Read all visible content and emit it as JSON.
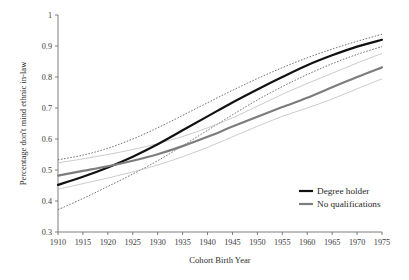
{
  "chart_data": {
    "type": "line",
    "title": "",
    "xlabel": "Cohort Birth Year",
    "ylabel": "Percentage don't mind ethnic in-law",
    "xlim": [
      1910,
      1975
    ],
    "ylim": [
      0.3,
      1
    ],
    "grid": false,
    "legend_position": "bottom-right",
    "x": [
      1910,
      1915,
      1920,
      1925,
      1930,
      1935,
      1940,
      1945,
      1950,
      1955,
      1960,
      1965,
      1970,
      1975
    ],
    "xticklabels": [
      "1910",
      "1915",
      "1920",
      "1925",
      "1930",
      "1935",
      "1940",
      "1945",
      "1950",
      "1955",
      "1960",
      "1965",
      "1970",
      "1975"
    ],
    "yticks": [
      0.3,
      0.4,
      0.5,
      0.6,
      0.7,
      0.8,
      0.9,
      1
    ],
    "yticklabels": [
      "0.3",
      "0.4",
      "0.5",
      "0.6",
      "0.7",
      "0.8",
      "0.9",
      "1"
    ],
    "series": [
      {
        "name": "Degree holder",
        "color": "#111111",
        "style": "solid",
        "values": [
          0.452,
          0.478,
          0.508,
          0.543,
          0.583,
          0.628,
          0.673,
          0.718,
          0.76,
          0.8,
          0.838,
          0.87,
          0.898,
          0.92
        ]
      },
      {
        "name": "Degree holder upper CI",
        "color": "#2b2b2b",
        "style": "dotted",
        "values": [
          0.533,
          0.548,
          0.57,
          0.6,
          0.636,
          0.676,
          0.717,
          0.757,
          0.795,
          0.83,
          0.862,
          0.89,
          0.915,
          0.938
        ]
      },
      {
        "name": "Degree holder lower CI",
        "color": "#2b2b2b",
        "style": "dotted",
        "values": [
          0.372,
          0.408,
          0.447,
          0.487,
          0.53,
          0.578,
          0.628,
          0.678,
          0.726,
          0.769,
          0.808,
          0.843,
          0.873,
          0.898
        ]
      },
      {
        "name": "No qualifications",
        "color": "#7d7d7d",
        "style": "solid",
        "values": [
          0.482,
          0.497,
          0.512,
          0.53,
          0.551,
          0.577,
          0.607,
          0.64,
          0.672,
          0.703,
          0.733,
          0.767,
          0.8,
          0.831
        ]
      },
      {
        "name": "No qualifications upper CI",
        "color": "#b4b4b4",
        "style": "solid",
        "values": [
          0.523,
          0.536,
          0.55,
          0.566,
          0.585,
          0.608,
          0.636,
          0.668,
          0.706,
          0.744,
          0.779,
          0.812,
          0.845,
          0.876
        ]
      },
      {
        "name": "No qualifications lower CI",
        "color": "#b4b4b4",
        "style": "solid",
        "values": [
          0.438,
          0.456,
          0.474,
          0.494,
          0.516,
          0.543,
          0.573,
          0.607,
          0.641,
          0.673,
          0.7,
          0.729,
          0.762,
          0.794
        ]
      }
    ],
    "annotations": []
  },
  "legend": {
    "items": [
      {
        "label": "Degree holder",
        "color": "#111111"
      },
      {
        "label": "No qualifications",
        "color": "#7d7d7d"
      }
    ]
  }
}
